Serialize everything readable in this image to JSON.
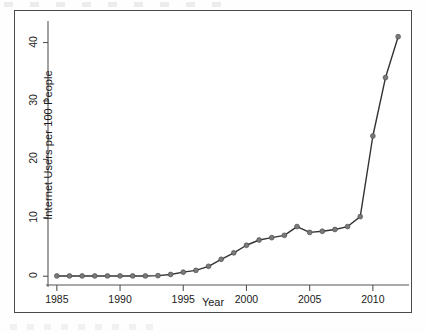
{
  "chart_data": {
    "type": "line",
    "title": "",
    "xlabel": "Year",
    "ylabel": "Internet Users per 100 People",
    "xlim": [
      1984.3,
      2012.7
    ],
    "ylim": [
      -1.5,
      43
    ],
    "xticks": [
      "1985",
      "1990",
      "1995",
      "2000",
      "2005",
      "2010"
    ],
    "xtick_values": [
      1985,
      1990,
      1995,
      2000,
      2005,
      2010
    ],
    "yticks": [
      "0",
      "10",
      "20",
      "30",
      "40"
    ],
    "ytick_values": [
      0,
      10,
      20,
      30,
      40
    ],
    "grid": false,
    "legend": null,
    "marker": "circle",
    "line_color": "#333333",
    "marker_color": "#7a7a7a",
    "x": [
      1985,
      1986,
      1987,
      1988,
      1989,
      1990,
      1991,
      1992,
      1993,
      1994,
      1995,
      1996,
      1997,
      1998,
      1999,
      2000,
      2001,
      2002,
      2003,
      2004,
      2005,
      2006,
      2007,
      2008,
      2009,
      2010,
      2011,
      2012
    ],
    "values": [
      0.05,
      0.05,
      0.05,
      0.05,
      0.05,
      0.05,
      0.05,
      0.05,
      0.1,
      0.3,
      0.7,
      1.0,
      1.7,
      2.9,
      4.0,
      5.3,
      6.2,
      6.6,
      7.0,
      8.5,
      7.5,
      7.7,
      8.0,
      8.5,
      10.2,
      24.0,
      34.0,
      41.0
    ],
    "series": [
      {
        "name": "Internet users per 100 people",
        "values": [
          0.05,
          0.05,
          0.05,
          0.05,
          0.05,
          0.05,
          0.05,
          0.05,
          0.1,
          0.3,
          0.7,
          1.0,
          1.7,
          2.9,
          4.0,
          5.3,
          6.2,
          6.6,
          7.0,
          8.5,
          7.5,
          7.7,
          8.0,
          8.5,
          10.2,
          24.0,
          34.0,
          41.0
        ]
      }
    ]
  },
  "colors": {
    "frame": "#4a4a4a",
    "axis": "#555555",
    "line": "#333333",
    "marker": "#7a7a7a",
    "text": "#1a1a1a",
    "background": "#ffffff"
  }
}
